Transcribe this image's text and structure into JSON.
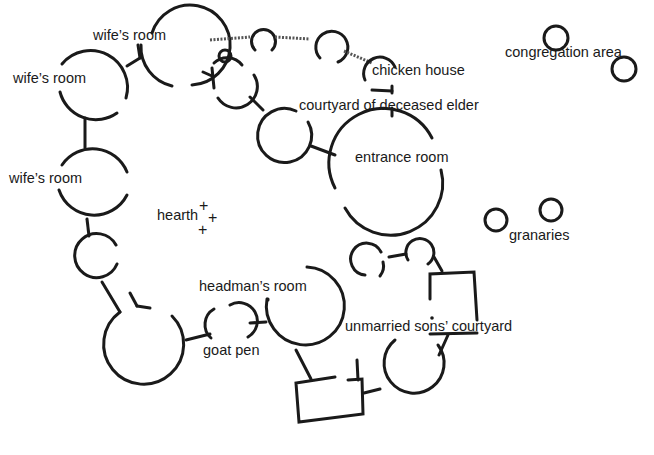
{
  "diagram": {
    "title": "",
    "background": "#ffffff",
    "ink": "#1a1a1a",
    "labels": {
      "wife_room_top": "wife’s room",
      "wife_room_left": "wife’s room",
      "wife_room_middle": "wife’s room",
      "chicken_house": "chicken house",
      "courtyard_deceased_elder": "courtyard of deceased elder",
      "entrance_room": "entrance room",
      "congregation_area": "congregation area",
      "hearth": "hearth",
      "granaries": "granaries",
      "headmans_room": "headman’s room",
      "goat_pen": "goat pen",
      "unmarried_sons_courtyard": "unmarried sons’ courtyard"
    },
    "hearth_markers": [
      "+",
      "+",
      "+"
    ]
  }
}
